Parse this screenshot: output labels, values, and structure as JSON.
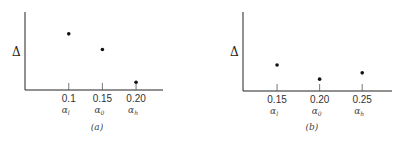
{
  "chart_data": [
    {
      "type": "scatter",
      "title": "",
      "panel_label": "(a)",
      "ylabel": "Δ",
      "xlabel": "",
      "categories": [
        "0.1",
        "0.15",
        "0.20"
      ],
      "x": [
        0.1,
        0.15,
        0.2
      ],
      "x_sublabels": [
        "αl",
        "α0",
        "αh"
      ],
      "values": [
        0.72,
        0.52,
        0.1
      ],
      "ylim": [
        0,
        1
      ],
      "xlim": [
        0.035,
        0.24
      ],
      "grid": false,
      "y_ticks_shown": false
    },
    {
      "type": "scatter",
      "title": "",
      "panel_label": "(b)",
      "ylabel": "Δ",
      "xlabel": "",
      "categories": [
        "0.15",
        "0.20",
        "0.25"
      ],
      "x": [
        0.15,
        0.2,
        0.25
      ],
      "x_sublabels": [
        "αl",
        "α0",
        "αh"
      ],
      "values": [
        0.33,
        0.15,
        0.23
      ],
      "ylim": [
        0,
        1
      ],
      "xlim": [
        0.11,
        0.285
      ],
      "grid": false,
      "y_ticks_shown": false
    }
  ]
}
